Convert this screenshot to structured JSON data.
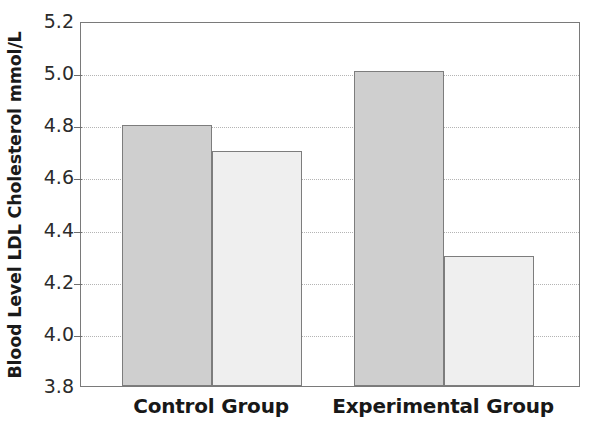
{
  "chart_data": {
    "type": "bar",
    "title": "",
    "subtitle": "",
    "xlabel": "",
    "ylabel": "Blood Level LDL Cholesterol mmol/L",
    "categories": [
      "Control Group",
      "Experimental Group"
    ],
    "series": [
      {
        "name": "Before",
        "values": [
          4.8,
          5.01
        ],
        "color": "#cfcfcf"
      },
      {
        "name": "After",
        "values": [
          4.7,
          4.3
        ],
        "color": "#efefef"
      }
    ],
    "ylim": [
      3.8,
      5.2
    ],
    "ytick_step": 0.2,
    "yticks": [
      "5.2",
      "5.0",
      "4.8",
      "4.6",
      "4.4",
      "4.2",
      "4.0",
      "3.8"
    ],
    "ytick_values": [
      5.2,
      5.0,
      4.8,
      4.6,
      4.4,
      4.2,
      4.0,
      3.8
    ],
    "grid": true,
    "grid_style": "dotted",
    "grid_color": "#b4b4b4",
    "legend": false,
    "legend_position": "none",
    "frame_color": "#7a7a7a",
    "bar_edge_color": "#7d7d7d",
    "background": "#ffffff",
    "bars": [
      {
        "group": "Control Group",
        "series": "Before",
        "value": 4.8,
        "fill": "#cfcfcf"
      },
      {
        "group": "Control Group",
        "series": "After",
        "value": 4.7,
        "fill": "#efefef"
      },
      {
        "group": "Experimental Group",
        "series": "Before",
        "value": 5.01,
        "fill": "#cfcfcf"
      },
      {
        "group": "Experimental Group",
        "series": "After",
        "value": 4.3,
        "fill": "#efefef"
      }
    ]
  }
}
